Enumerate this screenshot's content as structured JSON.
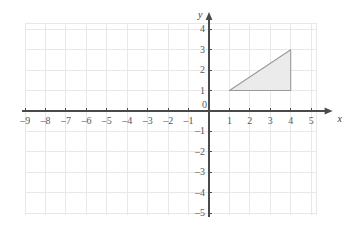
{
  "chart_data": {
    "type": "scatter",
    "title": "",
    "xlabel": "x",
    "ylabel": "y",
    "xlim": [
      -9,
      5
    ],
    "ylim": [
      -5,
      4
    ],
    "grid": true,
    "legend": false,
    "x_ticks": [
      -9,
      -8,
      -7,
      -6,
      -5,
      -4,
      -3,
      -2,
      -1,
      1,
      2,
      3,
      4,
      5
    ],
    "y_ticks": [
      4,
      3,
      2,
      1,
      -1,
      -2,
      -3,
      -4,
      -5
    ],
    "x_tick_labels": [
      "–9",
      "–8",
      "–7",
      "–6",
      "–5",
      "–4",
      "–3",
      "–2",
      "–1",
      "1",
      "2",
      "3",
      "4",
      "5"
    ],
    "y_tick_labels": [
      "4",
      "3",
      "2",
      "1",
      "–1",
      "–2",
      "–3",
      "–4",
      "–5"
    ],
    "origin_label": "0",
    "shapes": [
      {
        "name": "triangle",
        "kind": "polygon",
        "vertices": [
          [
            1,
            1
          ],
          [
            4,
            1
          ],
          [
            4,
            3
          ]
        ],
        "fill": "#ebebeb",
        "stroke": "#9a9a9c"
      }
    ],
    "colors": {
      "grid": "#e8e8ea",
      "axis": "#4a4a4c",
      "tick_label": "#58585a",
      "shape_fill": "#ebebeb",
      "shape_stroke": "#9a9a9c",
      "background": "#ffffff"
    }
  },
  "axis_names": {
    "x": "x",
    "y": "y"
  }
}
